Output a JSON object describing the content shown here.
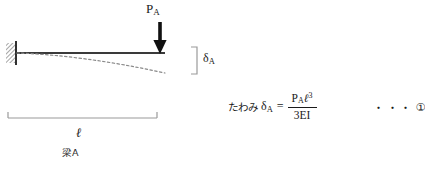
{
  "figure": {
    "title_caption": "梁A",
    "load": {
      "symbol": "P",
      "subscript": "A",
      "direction": "down"
    },
    "deflection": {
      "symbol": "δ",
      "subscript": "A"
    },
    "span": {
      "symbol": "ℓ"
    },
    "support": {
      "type": "fixed-wall-hatched"
    }
  },
  "equation": {
    "lhs_text": "たわみ",
    "lhs_symbol": "δ",
    "lhs_subscript": "A",
    "equals": "=",
    "numerator_load": "P",
    "numerator_load_sub": "A",
    "numerator_length": "ℓ",
    "numerator_exponent": "3",
    "denominator": "3EI",
    "reference_dots": "・・・",
    "reference_number": "①"
  },
  "colors": {
    "ink": "#1a1a1a",
    "beam": "#3a3a3a",
    "dashed_curve": "#8a8a8a",
    "dimension_line": "#9a9a9a",
    "bracket": "#9a9a9a",
    "background": "#ffffff"
  }
}
